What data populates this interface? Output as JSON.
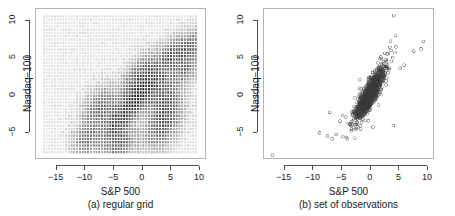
{
  "figure": {
    "background": "#ffffff",
    "axis_color": "#4d4d4d",
    "box_color": "#b4b4b4",
    "point_color": "#555555",
    "grid_color": "#808080"
  },
  "panels": [
    {
      "id": "a",
      "caption": "(a) regular grid",
      "xlabel": "S&P 500",
      "ylabel": "Nasdaq−100",
      "xticks": [
        "−15",
        "−10",
        "−5",
        "0",
        "5",
        "10"
      ],
      "xtick_values": [
        -15,
        -10,
        -5,
        0,
        5,
        10
      ],
      "yticks": [
        "−5",
        "0",
        "5",
        "10"
      ],
      "ytick_values": [
        -5,
        0,
        5,
        10
      ],
      "xlim": [
        -18.6,
        11.2
      ],
      "ylim": [
        -8.6,
        11.6
      ]
    },
    {
      "id": "b",
      "caption": "(b) set of observations",
      "xlabel": "S&P 500",
      "ylabel": "Nasdaq−100",
      "xticks": [
        "−15",
        "−10",
        "−5",
        "0",
        "5",
        "10"
      ],
      "xtick_values": [
        -15,
        -10,
        -5,
        0,
        5,
        10
      ],
      "yticks": [
        "−5",
        "0",
        "5",
        "10"
      ],
      "ytick_values": [
        -5,
        0,
        5,
        10
      ],
      "xlim": [
        -18.6,
        11.2
      ],
      "ylim": [
        -8.6,
        11.6
      ]
    }
  ],
  "chart_data": [
    {
      "type": "heatmap",
      "title": "(a) regular grid",
      "xlabel": "S&P 500",
      "ylabel": "Nasdaq−100",
      "xlim": [
        -18.6,
        11.2
      ],
      "ylim": [
        -8.6,
        11.6
      ],
      "xticks": [
        -15,
        -10,
        -5,
        0,
        5,
        10
      ],
      "yticks": [
        -5,
        0,
        5,
        10
      ],
      "grid": true,
      "legend": "none",
      "description": "A regular lattice of evaluation points covering the bivariate domain; each lattice cell is shaded by the estimated density of daily S&P 500 vs Nasdaq-100 returns, darkest along the positively-correlated diagonal band.",
      "grid_nx": 56,
      "grid_ny": 42,
      "grid_x_range": [
        -17.2,
        9.6
      ],
      "grid_y_range": [
        -7.8,
        10.6
      ],
      "density_centers": [
        {
          "x": -0.6,
          "y": -0.3,
          "weight": 1.0,
          "sx": 2.6,
          "sy": 2.3,
          "rho": 0.82
        },
        {
          "x": -7.2,
          "y": -1.8,
          "weight": 0.42,
          "sx": 1.6,
          "sy": 1.5,
          "rho": 0.4
        },
        {
          "x": -9.4,
          "y": -5.8,
          "weight": 0.33,
          "sx": 1.3,
          "sy": 1.2,
          "rho": 0.3
        },
        {
          "x": -4.6,
          "y": -4.6,
          "weight": 0.45,
          "sx": 1.5,
          "sy": 1.7,
          "rho": 0.5
        },
        {
          "x": -3.4,
          "y": -6.6,
          "weight": 0.35,
          "sx": 1.4,
          "sy": 1.2,
          "rho": 0.3
        },
        {
          "x": 3.6,
          "y": -4.2,
          "weight": 0.44,
          "sx": 1.7,
          "sy": 1.7,
          "rho": 0.45
        },
        {
          "x": 4.4,
          "y": -1.4,
          "weight": 0.38,
          "sx": 1.5,
          "sy": 1.6,
          "rho": 0.4
        },
        {
          "x": -1.5,
          "y": 1.6,
          "weight": 0.4,
          "sx": 1.2,
          "sy": 1.3,
          "rho": 0.4
        },
        {
          "x": 1.0,
          "y": 3.4,
          "weight": 0.33,
          "sx": 1.4,
          "sy": 1.3,
          "rho": 0.4
        },
        {
          "x": 5.4,
          "y": 5.4,
          "weight": 0.46,
          "sx": 1.4,
          "sy": 1.3,
          "rho": 0.5
        },
        {
          "x": 7.6,
          "y": 3.6,
          "weight": 0.4,
          "sx": 1.3,
          "sy": 1.2,
          "rho": 0.4
        },
        {
          "x": 8.4,
          "y": 6.4,
          "weight": 0.42,
          "sx": 1.2,
          "sy": 1.2,
          "rho": 0.5
        },
        {
          "x": 3.4,
          "y": 0.4,
          "weight": 0.3,
          "sx": 1.5,
          "sy": 1.5,
          "rho": 0.4
        }
      ]
    },
    {
      "type": "scatter",
      "title": "(b) set of observations",
      "xlabel": "S&P 500",
      "ylabel": "Nasdaq−100",
      "xlim": [
        -18.6,
        11.2
      ],
      "ylim": [
        -8.6,
        11.6
      ],
      "xticks": [
        -15,
        -10,
        -5,
        0,
        5,
        10
      ],
      "yticks": [
        -5,
        0,
        5,
        10
      ],
      "grid": false,
      "legend": "none",
      "marker": "open-circle",
      "n_points": 1400,
      "description": "Scatter of daily percentage returns, S&P 500 on x and Nasdaq-100 on y, strongly positively correlated with a dense elongated core near the origin and a few extreme outliers.",
      "core": {
        "mean_x": 0.03,
        "mean_y": 0.05,
        "sd_x": 1.15,
        "sd_y": 1.55,
        "rho": 0.86
      },
      "outliers": [
        {
          "x": -17.1,
          "y": -8.2
        },
        {
          "x": 4.3,
          "y": 10.7
        },
        {
          "x": 9.5,
          "y": 7.2
        },
        {
          "x": 9.1,
          "y": 6.2
        },
        {
          "x": 7.8,
          "y": 5.9
        },
        {
          "x": 4.2,
          "y": -4.2
        },
        {
          "x": -8.8,
          "y": -5.2
        },
        {
          "x": -7.4,
          "y": -5.6
        },
        {
          "x": -6.6,
          "y": -6.0
        },
        {
          "x": -5.9,
          "y": -5.4
        },
        {
          "x": -7.0,
          "y": -2.4
        },
        {
          "x": -5.2,
          "y": -3.6
        },
        {
          "x": -3.2,
          "y": -4.9
        },
        {
          "x": -2.3,
          "y": -4.6
        },
        {
          "x": 0.6,
          "y": -4.4
        },
        {
          "x": 5.4,
          "y": 3.6
        },
        {
          "x": 6.1,
          "y": 4.0
        },
        {
          "x": 3.6,
          "y": 6.4
        },
        {
          "x": 2.7,
          "y": 5.6
        },
        {
          "x": 2.0,
          "y": 5.1
        }
      ]
    }
  ]
}
